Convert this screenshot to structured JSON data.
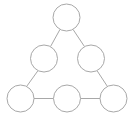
{
  "figure": {
    "width": 135,
    "height": 124,
    "background_color": "#ffffff",
    "stroke_color": "#a8a8a8",
    "node_fill_color": "#ffffff",
    "stroke_width": 1
  },
  "graph": {
    "node_count": 6,
    "edge_count": 6,
    "node_radius": 13.5,
    "nodes": [
      {
        "id": "n1",
        "name": "node-top",
        "label": "",
        "cx": 66.5,
        "cy": 17.5,
        "r": 13.5,
        "row": 0,
        "col": 0
      },
      {
        "id": "n2",
        "name": "node-middle-left",
        "label": "",
        "cx": 44.0,
        "cy": 58.5,
        "r": 13.5,
        "row": 1,
        "col": 0
      },
      {
        "id": "n3",
        "name": "node-middle-right",
        "label": "",
        "cx": 91.0,
        "cy": 58.5,
        "r": 13.5,
        "row": 1,
        "col": 1
      },
      {
        "id": "n4",
        "name": "node-bottom-left",
        "label": "",
        "cx": 20.5,
        "cy": 98.5,
        "r": 13.5,
        "row": 2,
        "col": 0
      },
      {
        "id": "n5",
        "name": "node-bottom-middle",
        "label": "",
        "cx": 67.0,
        "cy": 98.5,
        "r": 13.5,
        "row": 2,
        "col": 1
      },
      {
        "id": "n6",
        "name": "node-bottom-right",
        "label": "",
        "cx": 113.5,
        "cy": 98.5,
        "r": 13.5,
        "row": 2,
        "col": 2
      }
    ],
    "edges": [
      {
        "id": "e1",
        "name": "edge-top-to-middle-left",
        "from": "n1",
        "to": "n2",
        "x1": 60.0,
        "y1": 29.4,
        "x2": 50.5,
        "y2": 46.6
      },
      {
        "id": "e2",
        "name": "edge-top-to-middle-right",
        "from": "n1",
        "to": "n3",
        "x1": 73.0,
        "y1": 29.4,
        "x2": 84.5,
        "y2": 46.6
      },
      {
        "id": "e3",
        "name": "edge-middle-left-to-bottom-left",
        "from": "n2",
        "to": "n4",
        "x1": 38.0,
        "y1": 70.6,
        "x2": 26.5,
        "y2": 86.6
      },
      {
        "id": "e4",
        "name": "edge-middle-right-to-bottom-right",
        "from": "n3",
        "to": "n6",
        "x1": 97.0,
        "y1": 70.6,
        "x2": 107.5,
        "y2": 86.6
      },
      {
        "id": "e5",
        "name": "edge-bottom-left-to-bottom-middle",
        "from": "n4",
        "to": "n5",
        "x1": 34.0,
        "y1": 98.5,
        "x2": 53.5,
        "y2": 98.5
      },
      {
        "id": "e6",
        "name": "edge-bottom-middle-to-bottom-right",
        "from": "n5",
        "to": "n6",
        "x1": 80.5,
        "y1": 98.5,
        "x2": 100.0,
        "y2": 98.5
      }
    ]
  }
}
